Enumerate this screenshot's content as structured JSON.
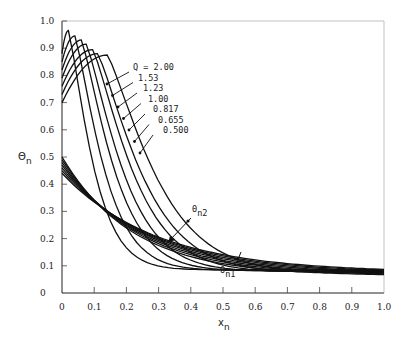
{
  "chart_data": {
    "type": "line",
    "title": "",
    "xlabel": "x_n",
    "ylabel": "Θ_n",
    "xlim": [
      0,
      1.0
    ],
    "ylim": [
      0,
      1.0
    ],
    "grid": false,
    "x_ticks": [
      "0",
      "0.1",
      "0.2",
      "0.3",
      "0.4",
      "0.5",
      "0.6",
      "0.7",
      "0.8",
      "0.9",
      "1.0"
    ],
    "y_ticks": [
      "0",
      "0.1",
      "0.2",
      "0.3",
      "0.4",
      "0.5",
      "0.6",
      "0.7",
      "0.8",
      "0.9",
      "1.0"
    ],
    "legend_title": "Q = ",
    "series": [
      {
        "name": "Q = 2.00",
        "peak": [
          0.02,
          0.965
        ],
        "start_upper": 0.88,
        "start_lower": 0.44,
        "end": 0.085
      },
      {
        "name": "1.53",
        "peak": [
          0.04,
          0.945
        ],
        "start_upper": 0.85,
        "start_lower": 0.45,
        "end": 0.083
      },
      {
        "name": "1.23",
        "peak": [
          0.06,
          0.93
        ],
        "start_upper": 0.82,
        "start_lower": 0.46,
        "end": 0.081
      },
      {
        "name": "1.00",
        "peak": [
          0.075,
          0.915
        ],
        "start_upper": 0.79,
        "start_lower": 0.47,
        "end": 0.079
      },
      {
        "name": "0.817",
        "peak": [
          0.095,
          0.895
        ],
        "start_upper": 0.76,
        "start_lower": 0.48,
        "end": 0.077
      },
      {
        "name": "0.655",
        "peak": [
          0.11,
          0.88
        ],
        "start_upper": 0.73,
        "start_lower": 0.49,
        "end": 0.075
      },
      {
        "name": "0.500",
        "peak": [
          0.14,
          0.875
        ],
        "start_upper": 0.7,
        "start_lower": 0.5,
        "end": 0.073
      }
    ],
    "annotations": [
      {
        "text": "Θ_n2",
        "target": [
          0.33,
          0.19
        ],
        "label_pos": [
          0.41,
          0.29
        ]
      },
      {
        "text": "Θ_n1",
        "target": [
          0.54,
          0.12
        ],
        "label_pos": [
          0.51,
          0.06
        ]
      }
    ]
  },
  "labels": {
    "ylabel_main": "Θ",
    "ylabel_sub": "n",
    "xlabel_main": "x",
    "xlabel_sub": "n",
    "legend": [
      "Q = 2.00",
      "1.53",
      "1.23",
      "1.00",
      "0.817",
      "0.655",
      "0.500"
    ],
    "ann_n2_main": "Θ",
    "ann_n2_sub": "n2",
    "ann_n1_main": "Θ",
    "ann_n1_sub": "n1"
  }
}
